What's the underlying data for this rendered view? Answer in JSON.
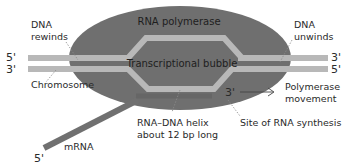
{
  "colors": {
    "polymerase": "#6f6f6f",
    "dna_strand": "#b8b8b8",
    "rna_strand": "#707070",
    "text": "#2a2a2a",
    "leader": "#8a8a8a"
  },
  "labels": {
    "rna_polymerase": "RNA polymerase",
    "transcriptional_bubble": "Transcriptional bubble",
    "dna_rewinds_1": "DNA",
    "dna_rewinds_2": "rewinds",
    "dna_unwinds_1": "DNA",
    "dna_unwinds_2": "unwinds",
    "chromosome": "Chromosome",
    "polymerase_movement_1": "Polymerase",
    "polymerase_movement_2": "movement",
    "helix_1": "RNA–DNA helix",
    "helix_2": "about 12 bp long",
    "synthesis_site": "Site of RNA synthesis",
    "mrna": "mRNA"
  },
  "ends": {
    "left_top": "5'",
    "left_bottom": "3'",
    "right_top": "3'",
    "right_bottom": "5'",
    "rna_3": "3'",
    "rna_5": "5'"
  }
}
